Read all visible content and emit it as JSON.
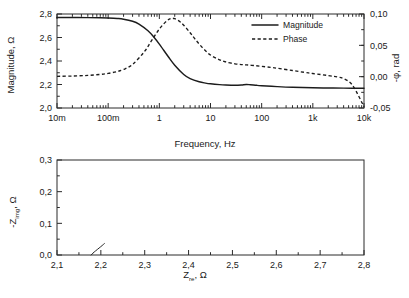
{
  "figure": {
    "background": "#ffffff",
    "line_color": "#1c1c1c"
  },
  "bode": {
    "xlabel": "Frequency, Hz",
    "ylabel_left": "Magnitude, Ω",
    "ylabel_right": "-φ, rad",
    "xticklabels": [
      "10m",
      "100m",
      "1",
      "10",
      "100",
      "1k",
      "10k"
    ],
    "yticklabels_left": [
      "2,0",
      "2,2",
      "2,4",
      "2,6",
      "2,8"
    ],
    "yticklabels_right": [
      "-0,05",
      "0,00",
      "0,05",
      "0,10"
    ],
    "legend": [
      {
        "label": "Magnitude",
        "style": "solid"
      },
      {
        "label": "Phase",
        "style": "dashed"
      }
    ]
  },
  "nyquist": {
    "xlabel_main": "Z",
    "xlabel_sub": "re",
    "xlabel_unit": ", Ω",
    "ylabel_main": "-Z",
    "ylabel_sub": "img",
    "ylabel_unit": ", Ω",
    "xticklabels": [
      "2,1",
      "2,2",
      "2,3",
      "2,4",
      "2,5",
      "2,6",
      "2,7",
      "2,8"
    ],
    "yticklabels": [
      "0,0",
      "0,1",
      "0,2",
      "0,3"
    ]
  },
  "chart_data": [
    {
      "type": "line",
      "id": "bode-plot",
      "title": "",
      "xlabel": "Frequency, Hz",
      "ylabel": "Magnitude, Ω",
      "ylabel_secondary": "-φ, rad",
      "xscale": "log",
      "xlim": [
        0.01,
        10000
      ],
      "ylim": [
        2.0,
        2.8
      ],
      "ylim_secondary": [
        -0.05,
        0.1
      ],
      "xticks": [
        0.01,
        0.1,
        1,
        10,
        100,
        1000,
        10000
      ],
      "xticklabels": [
        "10m",
        "100m",
        "1",
        "10",
        "100",
        "1k",
        "10k"
      ],
      "yticks": [
        2.0,
        2.2,
        2.4,
        2.6,
        2.8
      ],
      "yticks_secondary": [
        -0.05,
        0.0,
        0.05,
        0.1
      ],
      "grid": false,
      "legend_position": "top-right",
      "series": [
        {
          "name": "Magnitude",
          "axis": "left",
          "style": "solid",
          "x": [
            0.01,
            0.02,
            0.04,
            0.07,
            0.1,
            0.15,
            0.2,
            0.3,
            0.4,
            0.6,
            0.8,
            1.0,
            1.5,
            2.0,
            3.0,
            4.0,
            6.0,
            8.0,
            10,
            15,
            20,
            30,
            40,
            50,
            60,
            80,
            100,
            200,
            400,
            1000,
            2000,
            4000,
            10000
          ],
          "y": [
            2.77,
            2.77,
            2.769,
            2.768,
            2.766,
            2.762,
            2.756,
            2.738,
            2.714,
            2.657,
            2.598,
            2.544,
            2.436,
            2.364,
            2.285,
            2.25,
            2.223,
            2.212,
            2.206,
            2.199,
            2.196,
            2.194,
            2.196,
            2.2,
            2.198,
            2.193,
            2.19,
            2.182,
            2.176,
            2.172,
            2.17,
            2.169,
            2.168
          ]
        },
        {
          "name": "Phase",
          "axis": "right",
          "style": "dashed",
          "x": [
            0.01,
            0.02,
            0.04,
            0.07,
            0.1,
            0.15,
            0.2,
            0.3,
            0.5,
            0.7,
            1.0,
            1.4,
            1.7,
            2.0,
            2.5,
            3.0,
            4.0,
            5.0,
            7.0,
            10,
            15,
            20,
            30,
            40,
            50,
            70,
            100,
            150,
            200,
            400,
            700,
            1000,
            2000,
            3000,
            4000,
            6000,
            10000
          ],
          "y": [
            0.0005,
            0.001,
            0.002,
            0.0036,
            0.0052,
            0.0082,
            0.0115,
            0.0195,
            0.039,
            0.057,
            0.076,
            0.089,
            0.093,
            0.0925,
            0.088,
            0.082,
            0.07,
            0.06,
            0.046,
            0.0345,
            0.0268,
            0.0235,
            0.0205,
            0.0193,
            0.0188,
            0.0178,
            0.0165,
            0.0148,
            0.0135,
            0.0098,
            0.0068,
            0.005,
            0.0018,
            -0.0005,
            -0.0032,
            -0.014,
            -0.048
          ]
        }
      ]
    },
    {
      "type": "line",
      "id": "nyquist-plot",
      "title": "",
      "xlabel": "Z_re, Ω",
      "ylabel": "-Z_img, Ω",
      "xscale": "linear",
      "xlim": [
        2.1,
        2.8
      ],
      "ylim": [
        0.0,
        0.3
      ],
      "xticks": [
        2.1,
        2.2,
        2.3,
        2.4,
        2.5,
        2.6,
        2.7,
        2.8
      ],
      "xticklabels": [
        "2,1",
        "2,2",
        "2,3",
        "2,4",
        "2,5",
        "2,6",
        "2,7",
        "2,8"
      ],
      "yticks": [
        0.0,
        0.1,
        0.2,
        0.3
      ],
      "yticklabels": [
        "0,0",
        "0,1",
        "0,2",
        "0,3"
      ],
      "grid": false,
      "legend_position": "none",
      "series": [
        {
          "name": "Impedance locus",
          "style": "solid",
          "x": [
            2.178,
            2.182,
            2.188,
            2.196,
            2.203,
            2.208,
            2.212,
            2.209,
            2.207,
            2.212,
            2.22,
            2.232,
            2.245,
            2.258,
            2.272,
            2.286,
            2.3,
            2.318,
            2.336,
            2.356,
            2.378,
            2.398,
            2.418,
            2.438,
            2.458,
            2.478,
            2.498,
            2.518,
            2.538,
            2.556,
            2.574,
            2.592,
            2.61,
            2.628,
            2.648,
            2.668,
            2.69,
            2.712,
            2.732,
            2.75,
            2.762,
            2.77,
            2.774,
            2.776,
            2.776,
            2.775
          ],
          "y": [
            0.0,
            0.006,
            0.013,
            0.022,
            0.03,
            0.036,
            0.042,
            0.036,
            0.04,
            0.052,
            0.07,
            0.092,
            0.112,
            0.128,
            0.144,
            0.156,
            0.166,
            0.178,
            0.189,
            0.199,
            0.209,
            0.216,
            0.222,
            0.227,
            0.231,
            0.234,
            0.235,
            0.235,
            0.234,
            0.232,
            0.229,
            0.225,
            0.22,
            0.214,
            0.206,
            0.196,
            0.183,
            0.166,
            0.146,
            0.12,
            0.098,
            0.072,
            0.048,
            0.028,
            0.012,
            0.0
          ]
        }
      ]
    }
  ]
}
